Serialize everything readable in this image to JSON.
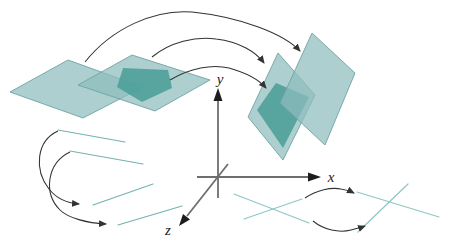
{
  "figure": {
    "axis_labels": {
      "x": "x",
      "y": "y",
      "z": "z"
    },
    "colors": {
      "background": "#ffffff",
      "plane_fill": "#8fbdbd",
      "plane_stroke": "#6fa3a3",
      "dark_region_fill": "#499e98",
      "segment_teal": "#74b2b2",
      "segment_teal_light": "#92c5c5",
      "arrow": "#333333",
      "axis": "#6e6e6e",
      "arrowhead": "#1d1d1d"
    }
  }
}
